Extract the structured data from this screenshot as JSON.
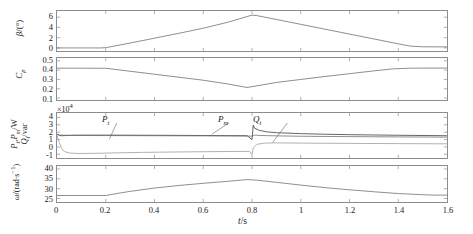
{
  "figure": {
    "xlabel": "t/s",
    "xticks": [
      "0",
      "0.2",
      "0.4",
      "0.6",
      "0.8",
      "1",
      "1.2",
      "1.4",
      "1.6"
    ],
    "xlim": [
      0,
      1.6
    ],
    "colors": {
      "axis": "#8d8d8d",
      "curve_dark": "#3a3a3a",
      "curve_mid": "#6e6e6e",
      "curve_light": "#9a9a9a",
      "background": "#ffffff"
    }
  },
  "chart_data": [
    {
      "type": "line",
      "panel": 1,
      "ylabel": "β/(°)",
      "ylabel_parts": {
        "symbol": "β",
        "unit": "/(°)"
      },
      "yticks": [
        "0",
        "2",
        "4",
        "6"
      ],
      "ylim": [
        -0.6,
        7.2
      ],
      "xlim": [
        0,
        1.6
      ],
      "grid": false,
      "series": [
        {
          "name": "beta",
          "x": [
            0,
            0.18,
            0.2,
            0.3,
            0.4,
            0.5,
            0.6,
            0.7,
            0.8,
            0.82,
            0.9,
            1.0,
            1.1,
            1.2,
            1.3,
            1.4,
            1.45,
            1.5,
            1.6
          ],
          "y": [
            0,
            0,
            0.05,
            0.95,
            1.9,
            2.85,
            3.85,
            5.0,
            6.4,
            6.3,
            5.55,
            4.6,
            3.65,
            2.7,
            1.75,
            0.8,
            0.35,
            0.22,
            0.2
          ]
        }
      ]
    },
    {
      "type": "line",
      "panel": 2,
      "ylabel": "C_p",
      "ylabel_parts": {
        "symbol": "C",
        "subscript": "p"
      },
      "yticks": [
        "0.1",
        "0.2",
        "0.3",
        "0.4",
        "0.5"
      ],
      "ylim": [
        0.08,
        0.53
      ],
      "xlim": [
        0,
        1.6
      ],
      "grid": false,
      "series": [
        {
          "name": "Cp",
          "x": [
            0,
            0.1,
            0.2,
            0.3,
            0.4,
            0.5,
            0.6,
            0.7,
            0.78,
            0.82,
            0.9,
            1.0,
            1.1,
            1.2,
            1.3,
            1.38,
            1.45,
            1.5,
            1.6
          ],
          "y": [
            0.421,
            0.421,
            0.42,
            0.388,
            0.356,
            0.324,
            0.292,
            0.252,
            0.214,
            0.232,
            0.268,
            0.3,
            0.332,
            0.362,
            0.392,
            0.414,
            0.421,
            0.422,
            0.422
          ]
        }
      ]
    },
    {
      "type": "line",
      "panel": 3,
      "ylabel_line1": "P_t,P_m/W",
      "ylabel_line2": "Q_t/var",
      "yticks": [
        "-1",
        "0",
        "1",
        "2",
        "3",
        "4"
      ],
      "ylim": [
        -1.5,
        4.6
      ],
      "xlim": [
        0,
        1.6
      ],
      "exponent": "×10",
      "exponent_power": "4",
      "grid": false,
      "annotations": [
        {
          "label": "P_t",
          "symbol": "P",
          "subscript": "t",
          "x": 0.23,
          "y": 3.55
        },
        {
          "label": "P_m",
          "symbol": "P",
          "subscript": "m",
          "x": 0.7,
          "y": 3.55
        },
        {
          "label": "Q_t",
          "symbol": "Q",
          "subscript": "t",
          "x": 0.93,
          "y": 3.55
        }
      ],
      "series": [
        {
          "name": "P_t",
          "x": [
            0,
            0.01,
            0.02,
            0.04,
            0.06,
            0.1,
            0.2,
            0.4,
            0.6,
            0.78,
            0.8,
            0.805,
            0.81,
            0.83,
            0.86,
            0.9,
            1.0,
            1.1,
            1.2,
            1.4,
            1.6
          ],
          "y": [
            1.75,
            1.55,
            1.52,
            1.55,
            1.58,
            1.6,
            1.6,
            1.58,
            1.55,
            1.52,
            1.0,
            2.95,
            2.55,
            2.25,
            2.05,
            1.93,
            1.8,
            1.72,
            1.66,
            1.58,
            1.52
          ]
        },
        {
          "name": "P_m",
          "x": [
            0,
            0.01,
            0.03,
            0.06,
            0.1,
            0.2,
            0.4,
            0.6,
            0.78,
            0.8,
            0.81,
            0.84,
            0.9,
            1.0,
            1.1,
            1.2,
            1.4,
            1.6
          ],
          "y": [
            1.7,
            1.62,
            1.58,
            1.56,
            1.55,
            1.54,
            1.52,
            1.5,
            1.48,
            1.46,
            1.6,
            1.55,
            1.5,
            1.45,
            1.42,
            1.4,
            1.36,
            1.33
          ]
        },
        {
          "name": "Q_t",
          "x": [
            0,
            0.01,
            0.02,
            0.03,
            0.05,
            0.08,
            0.12,
            0.18,
            0.25,
            0.35,
            0.5,
            0.7,
            0.79,
            0.8,
            0.805,
            0.82,
            0.85,
            0.9,
            1.0,
            1.2,
            1.4,
            1.6
          ],
          "y": [
            1.55,
            0.55,
            -0.25,
            -0.62,
            -0.82,
            -0.88,
            -0.88,
            -0.85,
            -0.8,
            -0.74,
            -0.68,
            -0.62,
            -0.6,
            -1.05,
            -0.15,
            0.35,
            0.52,
            0.55,
            0.52,
            0.48,
            0.45,
            0.42
          ]
        }
      ]
    },
    {
      "type": "line",
      "panel": 4,
      "ylabel": "ω/(rad·s⁻¹)",
      "ylabel_parts": {
        "symbol": "ω",
        "unit": "/(rad·s",
        "power": "-1",
        "close": ")"
      },
      "yticks": [
        "25",
        "30",
        "35",
        "40"
      ],
      "ylim": [
        23.2,
        41.5
      ],
      "xlim": [
        0,
        1.6
      ],
      "grid": false,
      "series": [
        {
          "name": "omega",
          "x": [
            0,
            0.1,
            0.2,
            0.25,
            0.3,
            0.4,
            0.5,
            0.6,
            0.7,
            0.78,
            0.82,
            0.9,
            1.0,
            1.1,
            1.2,
            1.3,
            1.4,
            1.5,
            1.55,
            1.6
          ],
          "y": [
            26.5,
            26.5,
            26.5,
            27.6,
            28.6,
            30.3,
            31.6,
            32.7,
            33.7,
            34.6,
            34.3,
            33.2,
            31.8,
            30.5,
            29.4,
            28.4,
            27.5,
            26.9,
            26.7,
            26.7
          ]
        }
      ]
    }
  ]
}
